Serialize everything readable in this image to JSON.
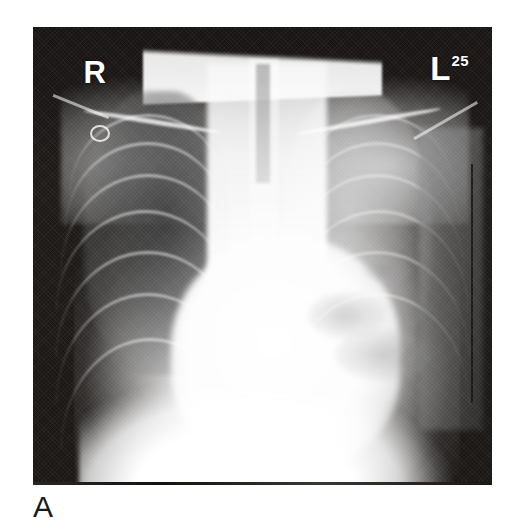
{
  "figure": {
    "panel_label": "A",
    "caption": "",
    "background_color": "#ffffff"
  },
  "radiograph": {
    "modality_name": "chest-radiograph",
    "projection": "AP",
    "background_color": "#171413",
    "markers": [
      {
        "name": "right-side-marker",
        "text": "R",
        "position": "top-left",
        "color": "#ffffff"
      },
      {
        "name": "left-side-marker",
        "text": "L",
        "superscript": "25",
        "position": "top-right",
        "color": "#ffffff"
      }
    ],
    "findings": {
      "right_lung": "aerated-lucent-with-visible-rib-shadows",
      "left_hemithorax": "dense-opacification",
      "mediastinum": "widened-white-central-density",
      "devices": "ecg-lead-and-wires"
    }
  }
}
